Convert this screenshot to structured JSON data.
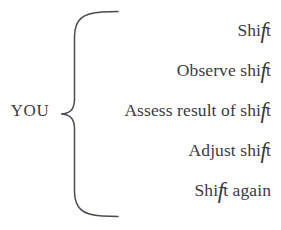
{
  "diagram": {
    "type": "brace-list",
    "background_color": "#ffffff",
    "ink_color": "#3a3a42",
    "brace_color": "#4a4a52",
    "label": {
      "text": "YOU",
      "position": "left"
    },
    "brace": {
      "name": "curly-brace",
      "orientation": "left-pointing",
      "spans_items": 5
    },
    "items": [
      {
        "prefix": "Shi",
        "swash": "f",
        "suffix": "t",
        "full_text": "Shift"
      },
      {
        "prefix": "Observe shi",
        "swash": "f",
        "suffix": "t",
        "full_text": "Observe shift"
      },
      {
        "prefix": "Assess result of shi",
        "swash": "f",
        "suffix": "t",
        "full_text": "Assess result of shift"
      },
      {
        "prefix": "Adjust shi",
        "swash": "f",
        "suffix": "t",
        "full_text": "Adjust shift"
      },
      {
        "prefix": "Shi",
        "swash": "f",
        "suffix": "t again",
        "full_text": "Shift again"
      }
    ]
  }
}
